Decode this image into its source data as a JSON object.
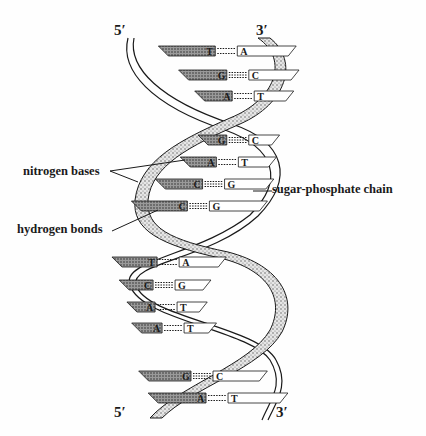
{
  "diagram": {
    "ends": {
      "top_left": "5′",
      "top_right": "3′",
      "bottom_left": "5′",
      "bottom_right": "3′"
    },
    "callouts": {
      "nitrogen_bases": "nitrogen bases",
      "hydrogen_bonds": "hydrogen bonds",
      "sugar_phosphate_chain": "sugar-phosphate chain"
    },
    "base_pairs": [
      {
        "left": "T",
        "right": "A",
        "y": 51
      },
      {
        "left": "G",
        "right": "C",
        "y": 75
      },
      {
        "left": "A",
        "right": "T",
        "y": 96
      },
      {
        "left": "G",
        "right": "C",
        "y": 140
      },
      {
        "left": "A",
        "right": "T",
        "y": 162
      },
      {
        "left": "C",
        "right": "G",
        "y": 184
      },
      {
        "left": "C",
        "right": "G",
        "y": 206
      },
      {
        "left": "T",
        "right": "A",
        "y": 262
      },
      {
        "left": "C",
        "right": "G",
        "y": 285
      },
      {
        "left": "A",
        "right": "T",
        "y": 307
      },
      {
        "left": "A",
        "right": "T",
        "y": 328
      },
      {
        "left": "G",
        "right": "C",
        "y": 376
      },
      {
        "left": "A",
        "right": "T",
        "y": 398
      }
    ],
    "colors": {
      "ink": "#1a1a1a",
      "stipple": "#9a9a9a",
      "paper": "#fefefe"
    }
  }
}
